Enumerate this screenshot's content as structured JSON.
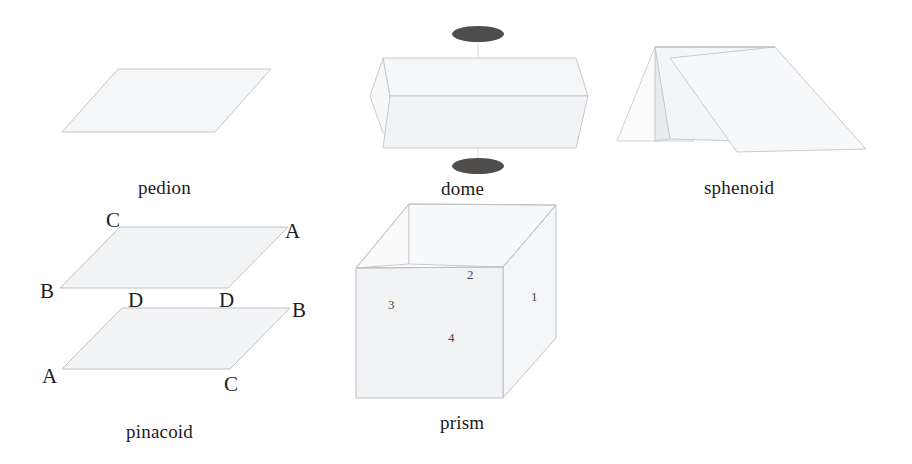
{
  "figure": {
    "background_color": "#ffffff",
    "line_color": "#b9bcc0",
    "fill_color": "#f4f5f6",
    "ellipse_color": "#4f4c4c",
    "text_color": "#231f20"
  },
  "forms": [
    {
      "id": "pedion",
      "label": "pedion",
      "label_x": 138,
      "label_y": 178,
      "description": "single face, one parallelogram plane"
    },
    {
      "id": "pinacoid",
      "label": "pinacoid",
      "label_x": 126,
      "label_y": 422,
      "description": "two parallel faces",
      "vertex_labels": [
        {
          "text": "C",
          "x": 106,
          "y": 210
        },
        {
          "text": "A",
          "x": 285,
          "y": 221
        },
        {
          "text": "B",
          "x": 40,
          "y": 281
        },
        {
          "text": "D",
          "x": 128,
          "y": 290
        },
        {
          "text": "D",
          "x": 219,
          "y": 290
        },
        {
          "text": "B",
          "x": 292,
          "y": 300
        },
        {
          "text": "A",
          "x": 42,
          "y": 366
        },
        {
          "text": "C",
          "x": 224,
          "y": 374
        }
      ]
    },
    {
      "id": "dome",
      "label": "dome",
      "label_x": 441,
      "label_y": 179,
      "description": "two faces related by a mirror plane, shown with mirror markers"
    },
    {
      "id": "sphenoid",
      "label": "sphenoid",
      "label_x": 704,
      "label_y": 178,
      "description": "two faces related by a 2-fold axis"
    },
    {
      "id": "prism",
      "label": "prism",
      "label_x": 440,
      "label_y": 413,
      "description": "four faces parallel to a common axis",
      "face_numbers": [
        {
          "text": "1",
          "x": 531,
          "y": 290
        },
        {
          "text": "2",
          "x": 467,
          "y": 268
        },
        {
          "text": "3",
          "x": 388,
          "y": 298
        },
        {
          "text": "4",
          "x": 448,
          "y": 331
        }
      ]
    }
  ]
}
